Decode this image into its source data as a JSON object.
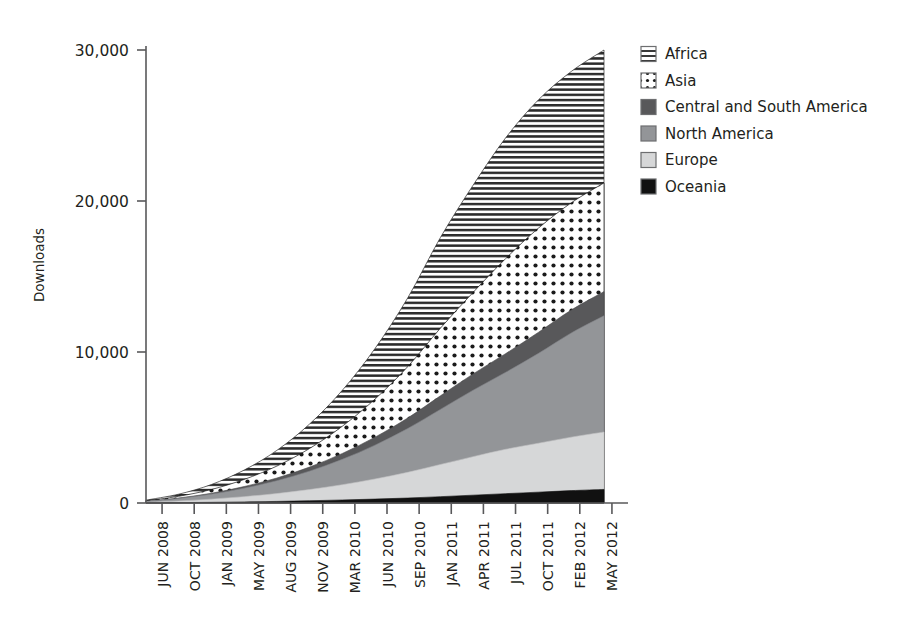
{
  "figure": {
    "background": "#ffffff",
    "axis_color": "#58585a",
    "text_color": "#231f20"
  },
  "axes": {
    "y_title": "Downloads",
    "y_ticks": [
      "0",
      "10,000",
      "20,000",
      "30,000"
    ],
    "x_ticks": [
      "JUN 2008",
      "OCT 2008",
      "JAN 2009",
      "MAY 2009",
      "AUG 2009",
      "NOV 2009",
      "MAR 2010",
      "JUN 2010",
      "SEP 2010",
      "JAN 2011",
      "APR 2011",
      "JUL 2011",
      "OCT 2011",
      "FEB 2012",
      "MAY 2012"
    ]
  },
  "legend": {
    "position": "right-top",
    "items": [
      {
        "label": "Africa",
        "swatch": "horizontal-lines-swatch",
        "fill": "#ffffff",
        "pattern": "hlines",
        "color": "#2b2b2b"
      },
      {
        "label": "Asia",
        "swatch": "dots-swatch",
        "fill": "#ffffff",
        "pattern": "dots",
        "color": "#1a1a1a"
      },
      {
        "label": "Central and South America",
        "swatch": "dark-gray-swatch",
        "fill": "#58585a",
        "pattern": "solid",
        "color": "#58585a"
      },
      {
        "label": "North America",
        "swatch": "mid-gray-swatch",
        "fill": "#939598",
        "pattern": "solid",
        "color": "#939598"
      },
      {
        "label": "Europe",
        "swatch": "light-gray-swatch",
        "fill": "#d6d7d8",
        "pattern": "solid",
        "color": "#d6d7d8"
      },
      {
        "label": "Oceania",
        "swatch": "black-swatch",
        "fill": "#111111",
        "pattern": "solid",
        "color": "#111111"
      }
    ]
  },
  "chart_data": {
    "type": "area",
    "stacked": true,
    "title": "",
    "xlabel": "",
    "ylabel": "Downloads",
    "ylim": [
      0,
      30000
    ],
    "grid": false,
    "legend_position": "right-top",
    "categories": [
      "JUN 2008",
      "OCT 2008",
      "JAN 2009",
      "MAY 2009",
      "AUG 2009",
      "NOV 2009",
      "MAR 2010",
      "JUN 2010",
      "SEP 2010",
      "JAN 2011",
      "APR 2011",
      "JUL 2011",
      "OCT 2011",
      "FEB 2012",
      "MAY 2012"
    ],
    "series": [
      {
        "name": "Oceania",
        "values": [
          10,
          25,
          45,
          70,
          105,
          150,
          200,
          260,
          330,
          420,
          520,
          620,
          720,
          820,
          900
        ]
      },
      {
        "name": "Europe",
        "values": [
          40,
          110,
          210,
          350,
          520,
          740,
          1010,
          1330,
          1700,
          2130,
          2550,
          2940,
          3240,
          3540,
          3800
        ]
      },
      {
        "name": "North America",
        "values": [
          60,
          170,
          330,
          560,
          850,
          1220,
          1680,
          2240,
          2900,
          3650,
          4400,
          5100,
          5950,
          6900,
          7700
        ]
      },
      {
        "name": "Central and South America",
        "values": [
          10,
          30,
          60,
          110,
          180,
          270,
          390,
          530,
          700,
          900,
          1080,
          1240,
          1400,
          1520,
          1600
        ]
      },
      {
        "name": "Asia",
        "values": [
          30,
          110,
          250,
          470,
          790,
          1230,
          1800,
          2520,
          3400,
          4480,
          5400,
          6300,
          6900,
          7100,
          7200
        ]
      },
      {
        "name": "Africa",
        "values": [
          40,
          140,
          330,
          620,
          1040,
          1620,
          2380,
          3350,
          4550,
          6000,
          7100,
          8000,
          8500,
          8700,
          8800
        ]
      }
    ],
    "series_totals_last_point": {
      "Oceania": 900,
      "Europe": 4700,
      "North America": 12400,
      "Central and South America": 14000,
      "Asia": 21200,
      "Africa": 30000
    },
    "cumulative_tops_last_point": [
      900,
      3800,
      8600,
      10000,
      17200,
      26000
    ]
  }
}
